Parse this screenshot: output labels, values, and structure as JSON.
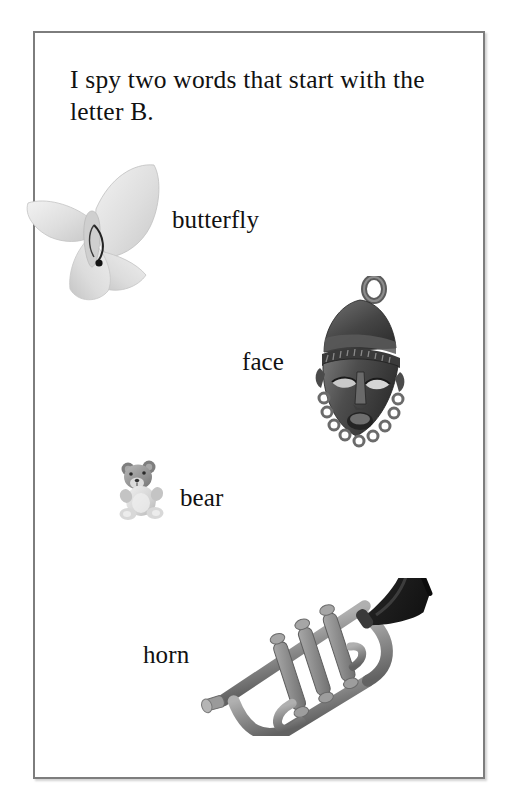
{
  "page": {
    "background_color": "#ffffff",
    "frame": {
      "border_color": "#7d7d7d",
      "fill_color": "#ffffff"
    }
  },
  "heading": {
    "text": "I spy two words that start with the letter B."
  },
  "items": [
    {
      "label": "butterfly",
      "picture": "butterfly-image",
      "colors": {
        "body": "#d8d8d8",
        "wing": "#e6e6e6",
        "detail": "#2b2b2b"
      }
    },
    {
      "label": "face",
      "picture": "mask-face-image",
      "colors": {
        "body": "#4a4a4a",
        "highlight": "#8d8d8d",
        "shadow": "#2a2a2a"
      }
    },
    {
      "label": "bear",
      "picture": "teddy-bear-image",
      "colors": {
        "body": "#d2d2d2",
        "head": "#9a9a9a",
        "detail": "#3c3c3c"
      }
    },
    {
      "label": "horn",
      "picture": "trumpet-image",
      "colors": {
        "body": "#8a8a8a",
        "bell": "#272727",
        "highlight": "#b4b4b4"
      }
    }
  ]
}
